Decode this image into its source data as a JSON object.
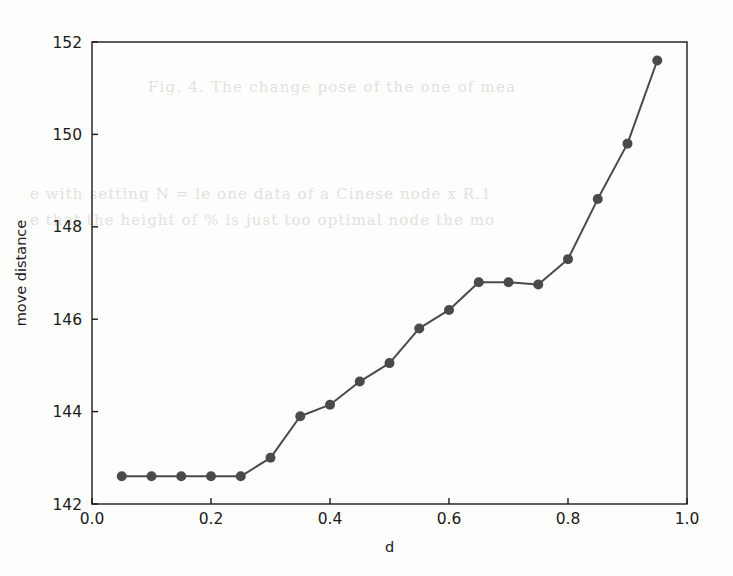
{
  "figure": {
    "background_color": "#fdfdfc",
    "plot_area": {
      "left": 92,
      "top": 42,
      "right": 687,
      "bottom": 504
    }
  },
  "bleed_through_text": {
    "line1": "Fig. 4. The change       pose of  the  one  of  mea",
    "line2": "e with  setting  N =        le one data  of  a  Cinese  node  x  R.1",
    "line3": "e  that  the  height  of  %  is  just  too  optimal    node  the  mo"
  },
  "chart_data": {
    "type": "line",
    "title": "",
    "xlabel": "d",
    "ylabel": "move distance",
    "xlim": [
      0.0,
      1.0
    ],
    "ylim": [
      142,
      152
    ],
    "xticks": [
      0.0,
      0.2,
      0.4,
      0.6,
      0.8,
      1.0
    ],
    "xtick_labels": [
      "0.0",
      "0.2",
      "0.4",
      "0.6",
      "0.8",
      "1.0"
    ],
    "yticks": [
      142,
      144,
      146,
      148,
      150,
      152
    ],
    "ytick_labels": [
      "142",
      "144",
      "146",
      "148",
      "150",
      "152"
    ],
    "grid": false,
    "legend": null,
    "line_color": "#4a4a4a",
    "marker_color": "#4a4a4a",
    "marker": "circle",
    "marker_size": 10,
    "line_width": 2,
    "x": [
      0.05,
      0.1,
      0.15,
      0.2,
      0.25,
      0.3,
      0.35,
      0.4,
      0.45,
      0.5,
      0.55,
      0.6,
      0.65,
      0.7,
      0.75,
      0.8,
      0.85,
      0.9,
      0.95
    ],
    "values": [
      142.6,
      142.6,
      142.6,
      142.6,
      142.6,
      143.0,
      143.9,
      144.15,
      144.65,
      145.05,
      145.8,
      146.2,
      146.8,
      146.8,
      146.75,
      147.3,
      148.6,
      149.8,
      151.6
    ]
  }
}
